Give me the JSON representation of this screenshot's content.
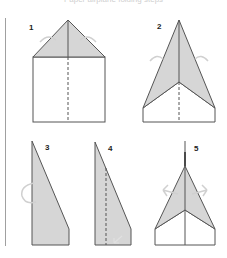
{
  "caption": "Paper airplane folding steps",
  "colors": {
    "line": "#555555",
    "fill": "#d6d6d6",
    "paper": "#ffffff",
    "arrow": "#d0d0d0",
    "rule": "#a0a0a0"
  },
  "steps": [
    {
      "number": "1",
      "description": "Fold top corners down to center crease"
    },
    {
      "number": "2",
      "description": "Fold edges again to the center line"
    },
    {
      "number": "3",
      "description": "Fold the plane in half"
    },
    {
      "number": "4",
      "description": "Fold the wing down along the dashed line"
    },
    {
      "number": "5",
      "description": "Unfold the wings outward"
    }
  ]
}
